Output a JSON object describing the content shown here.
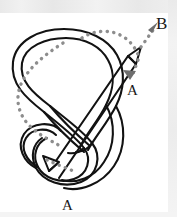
{
  "figure": {
    "type": "knot-diagram",
    "labels": {
      "b": "B",
      "a_right": "A",
      "a_bottom": "A"
    },
    "colors": {
      "stroke": "#121212",
      "dotted": "#8a8a8a",
      "arrow_fill": "#6e6e6e",
      "background": "#ffffff",
      "scan_strip": "#ededed"
    },
    "elements": {
      "band_label": "ribbon-band",
      "dotted_label": "dotted-guide-path",
      "arrow_b_label": "dotted-arrow-to-B",
      "arrow_a_right_label": "small-arrow-to-A-right",
      "arrow_a_bottom_label": "band-arrow-to-A-bottom",
      "band_tip_top_label": "band-arrow-tip-top",
      "band_tip_bottom_label": "band-arrow-tip-bottom"
    }
  }
}
